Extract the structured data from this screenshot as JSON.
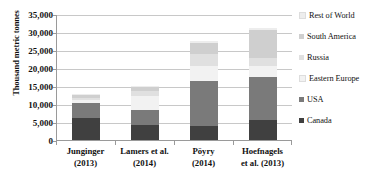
{
  "chart_data": {
    "type": "bar",
    "subtype": "stacked-bar",
    "title": "",
    "xlabel": "",
    "ylabel": "Thousand metric tonnes",
    "ylim": [
      0,
      35000
    ],
    "ytick_step": 5000,
    "ytick_labels": [
      "35,000",
      "30,000",
      "25,000",
      "20,000",
      "15,000",
      "10,000",
      "5,000",
      "0"
    ],
    "ytick_values": [
      35000,
      30000,
      25000,
      20000,
      15000,
      10000,
      5000,
      0
    ],
    "grid": true,
    "legend_position": "right",
    "categories": [
      "Junginger (2013)",
      "Lamers et al. (2014)",
      "Pöyry (2014)",
      "Hoefnagels et al. (2013)"
    ],
    "category_lines": [
      [
        "Junginger",
        "(2013)"
      ],
      [
        "Lamers et al.",
        "(2014)"
      ],
      [
        "Pöyry",
        "(2014)"
      ],
      [
        "Hoefnagels",
        "et al. (2013)"
      ]
    ],
    "series": [
      {
        "name": "Canada",
        "color": "#404040",
        "values": [
          6000,
          4300,
          4000,
          5500
        ]
      },
      {
        "name": "USA",
        "color": "#7a7a7a",
        "values": [
          4300,
          4000,
          12500,
          12000
        ]
      },
      {
        "name": "Eastern Europe",
        "color": "#f2f2f2",
        "values": [
          700,
          3900,
          4200,
          3200
        ]
      },
      {
        "name": "Russia",
        "color": "#e0e0e0",
        "values": [
          800,
          1300,
          3300,
          2200
        ]
      },
      {
        "name": "South America",
        "color": "#cfcfcf",
        "values": [
          700,
          1200,
          3000,
          7600
        ]
      },
      {
        "name": "Rest of World",
        "color": "#ededed",
        "values": [
          300,
          300,
          500,
          700
        ]
      }
    ],
    "totals": [
      12800,
      15000,
      27500,
      31200
    ],
    "legend_entries": [
      {
        "label": "Rest of World",
        "color": "#ededed"
      },
      {
        "label": "South America",
        "color": "#cfcfcf"
      },
      {
        "label": "Russia",
        "color": "#e0e0e0"
      },
      {
        "label": "Eastern Europe",
        "color": "#f2f2f2"
      },
      {
        "label": "USA",
        "color": "#7a7a7a"
      },
      {
        "label": "Canada",
        "color": "#404040"
      }
    ]
  }
}
